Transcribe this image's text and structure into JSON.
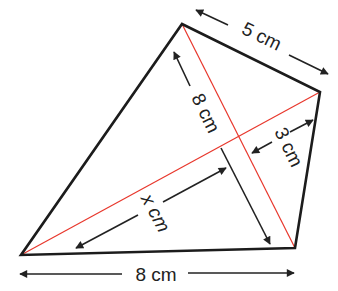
{
  "figure": {
    "type": "quadrilateral-with-diagonals",
    "colors": {
      "outline": "#1c1c1c",
      "diagonal": "#e8372c",
      "arrow": "#222222",
      "background": "#ffffff"
    },
    "vertices": {
      "top": [
        182,
        24
      ],
      "right": [
        320,
        92
      ],
      "bottom_right": [
        295,
        248
      ],
      "bottom_left": [
        21,
        255
      ]
    },
    "labels": {
      "top_side": "5 cm",
      "diagonal_ac": "8 cm",
      "perpendicular": "3 cm",
      "unknown": "x cm",
      "bottom_side": "8 cm"
    }
  }
}
